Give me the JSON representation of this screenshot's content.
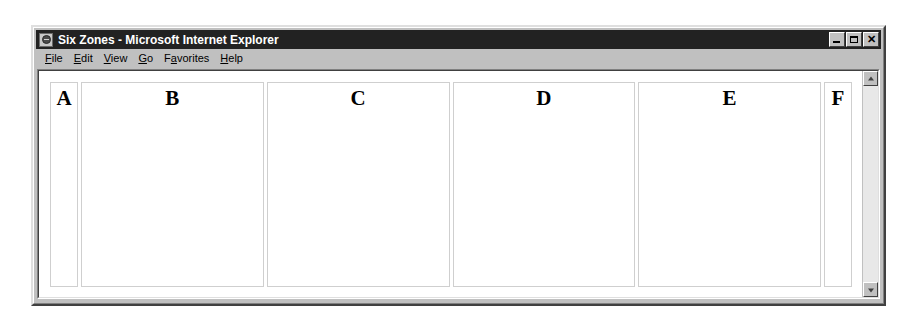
{
  "window": {
    "title": "Six Zones - Microsoft Internet Explorer",
    "icon": "ie-document-icon",
    "titlebar_color": "#222222",
    "frame_color": "#c0c0c0",
    "controls": {
      "minimize_label": "_",
      "maximize_label": "□",
      "close_label": "✕"
    }
  },
  "menubar": {
    "items": [
      {
        "label": "File",
        "accel": "F"
      },
      {
        "label": "Edit",
        "accel": "E"
      },
      {
        "label": "View",
        "accel": "V"
      },
      {
        "label": "Go",
        "accel": "G"
      },
      {
        "label": "Favorites",
        "accel": "a"
      },
      {
        "label": "Help",
        "accel": "H"
      }
    ]
  },
  "page": {
    "background": "#ffffff",
    "zone_border_color": "#cfcfcf",
    "zones": [
      {
        "letter": "A",
        "width": "narrow"
      },
      {
        "letter": "B",
        "width": "wide"
      },
      {
        "letter": "C",
        "width": "wide"
      },
      {
        "letter": "D",
        "width": "wide"
      },
      {
        "letter": "E",
        "width": "wide"
      },
      {
        "letter": "F",
        "width": "narrow"
      }
    ]
  },
  "scrollbar": {
    "up_arrow": "scroll-up-arrow",
    "down_arrow": "scroll-down-arrow",
    "thumb_visible": false
  }
}
